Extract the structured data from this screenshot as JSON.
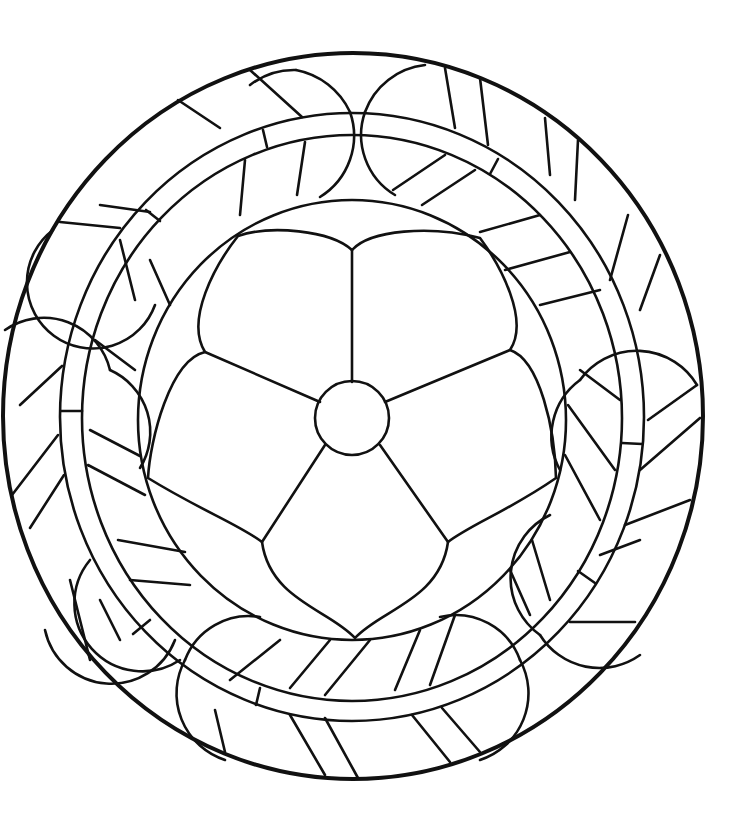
{
  "image": {
    "title": "Circular stained glass pattern with five-petal flower",
    "description": "Black line art on white: outer circle, decorative band with lobes and hatching, inner circle containing a five-petal flower with a round center",
    "colors": {
      "background": "#ffffff",
      "line": "#111111"
    }
  },
  "pattern": {
    "outer_circle": {
      "cx": 353,
      "cy": 416,
      "rx": 350,
      "ry": 363
    },
    "band_outer": {
      "cx": 352,
      "cy": 417,
      "rx": 292,
      "ry": 304
    },
    "band_inner": {
      "cx": 352,
      "cy": 418,
      "rx": 270,
      "ry": 283
    },
    "inner_circle": {
      "cx": 352,
      "cy": 420,
      "rx": 214,
      "ry": 220
    },
    "flower": {
      "petals": 5,
      "center": {
        "cx": 352,
        "cy": 418,
        "r": 37
      }
    }
  }
}
